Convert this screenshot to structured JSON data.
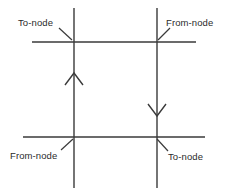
{
  "diagram": {
    "type": "link-node-direction-diagram",
    "stroke_color": "#3a3a3a",
    "arrow_color": "#3a3a3a",
    "text_color": "#2b2b2b",
    "background_color": "#ffffff",
    "labels": {
      "top_left": "To-node",
      "top_right": "From-node",
      "bottom_left": "From-node",
      "bottom_right": "To-node"
    },
    "arrows": {
      "left_vertical": "up",
      "right_vertical": "down"
    },
    "lines": [
      {
        "name": "horizontal-top",
        "x1": 32,
        "y1": 42,
        "x2": 196,
        "y2": 42
      },
      {
        "name": "horizontal-bottom",
        "x1": 23,
        "y1": 137,
        "x2": 205,
        "y2": 137
      },
      {
        "name": "vertical-left",
        "x1": 74,
        "y1": 8,
        "x2": 74,
        "y2": 188
      },
      {
        "name": "vertical-right",
        "x1": 157,
        "y1": 8,
        "x2": 157,
        "y2": 188
      }
    ],
    "nodes": [
      {
        "name": "node-top-left",
        "x": 74,
        "y": 42
      },
      {
        "name": "node-top-right",
        "x": 157,
        "y": 42
      },
      {
        "name": "node-bottom-left",
        "x": 74,
        "y": 137
      },
      {
        "name": "node-bottom-right",
        "x": 157,
        "y": 137
      }
    ]
  }
}
